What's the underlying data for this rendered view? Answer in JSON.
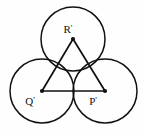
{
  "figure": {
    "background_color": "#fefefe",
    "stroke_color": "#111111",
    "width": 143,
    "height": 133,
    "circle_radius": 32,
    "labels": {
      "top": "R",
      "bottom_left": "Q",
      "bottom_right": "P",
      "prime_mark": "'"
    },
    "circles": [
      {
        "name": "top-circle",
        "cx": 73,
        "cy": 39,
        "r": 32
      },
      {
        "name": "left-circle",
        "cx": 42,
        "cy": 91,
        "r": 32
      },
      {
        "name": "right-circle",
        "cx": 105,
        "cy": 91,
        "r": 32
      }
    ],
    "triangle": {
      "name": "center-triangle",
      "points": "73,39 42,91 105,91",
      "vertices": [
        {
          "name": "R",
          "x": 73,
          "y": 39
        },
        {
          "name": "Q",
          "x": 42,
          "y": 91
        },
        {
          "name": "P",
          "x": 105,
          "y": 91
        }
      ]
    },
    "label_positions": {
      "top": {
        "x": 68,
        "y": 33
      },
      "bottom_left": {
        "x": 30,
        "y": 105
      },
      "bottom_right": {
        "x": 93,
        "y": 105
      }
    }
  }
}
